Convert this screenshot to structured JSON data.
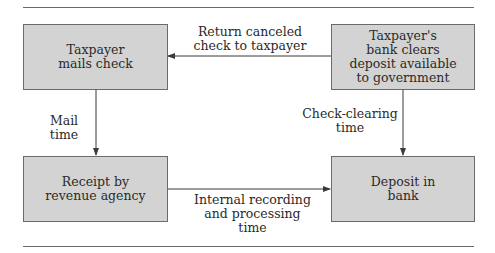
{
  "diagram": {
    "nodes": {
      "taxpayer_mails_check": "Taxpayer\nmails check",
      "bank_clears": "Taxpayer's\nbank clears\ndeposit available\nto government",
      "receipt_by_agency": "Receipt by\nrevenue agency",
      "deposit_in_bank": "Deposit in\nbank"
    },
    "edges": {
      "return_canceled": "Return canceled\ncheck to taxpayer",
      "mail_time": "Mail time",
      "check_clearing": "Check-clearing\ntime",
      "internal_recording": "Internal recording\nand processing time"
    },
    "colors": {
      "box_fill": "#d3d3d3",
      "line": "#3a3a3a"
    }
  }
}
